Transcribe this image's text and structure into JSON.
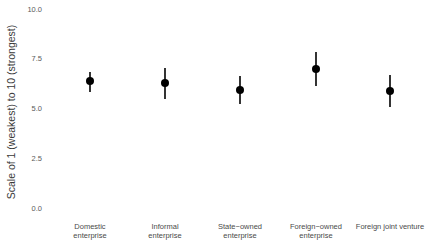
{
  "chart_data": {
    "type": "scatter",
    "subtype": "point-with-error-bars",
    "title": "",
    "xlabel": "",
    "ylabel": "Scale of 1 (weakest) to 10 (strongest)",
    "ylim": [
      0,
      10
    ],
    "yticks": [
      "0.0",
      "2.5",
      "5.0",
      "7.5",
      "10.0"
    ],
    "ytick_values": [
      0,
      2.5,
      5,
      7.5,
      10
    ],
    "grid": false,
    "legend": null,
    "categories": [
      [
        "Domestic",
        "enterprise"
      ],
      [
        "Informal",
        "enterprise"
      ],
      [
        "State−owned",
        "enterprise"
      ],
      [
        "Foreign−owned",
        "enterprise"
      ],
      [
        "Foreign joint venture"
      ]
    ],
    "category_names": [
      "Domestic enterprise",
      "Informal enterprise",
      "State-owned enterprise",
      "Foreign-owned enterprise",
      "Foreign joint venture"
    ],
    "values": [
      6.38,
      6.28,
      5.93,
      6.98,
      5.88
    ],
    "error_low": [
      5.83,
      5.48,
      5.23,
      6.13,
      5.08
    ],
    "error_high": [
      6.83,
      7.04,
      6.63,
      7.84,
      6.68
    ],
    "point_color": "#000000",
    "errorbar_color": "#000000"
  }
}
